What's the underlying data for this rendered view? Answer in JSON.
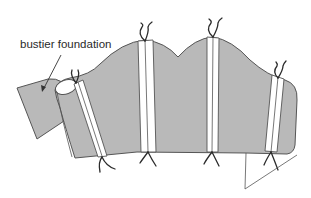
{
  "figure": {
    "type": "sewing-illustration",
    "labels": {
      "foundation": "bustier foundation"
    },
    "colors": {
      "fabric_fill": "#b9b9b9",
      "outline": "#555555",
      "channel_fill": "#ffffff",
      "tie": "#2b2b2b",
      "background": "#ffffff"
    },
    "boning_channels": [
      {
        "id": 1,
        "position": "left",
        "ties": [
          "top",
          "bottom"
        ]
      },
      {
        "id": 2,
        "position": "center-left",
        "ties": [
          "top",
          "bottom"
        ]
      },
      {
        "id": 3,
        "position": "center-right",
        "ties": [
          "top",
          "bottom"
        ]
      },
      {
        "id": 4,
        "position": "right",
        "ties": [
          "top",
          "bottom"
        ]
      }
    ]
  }
}
